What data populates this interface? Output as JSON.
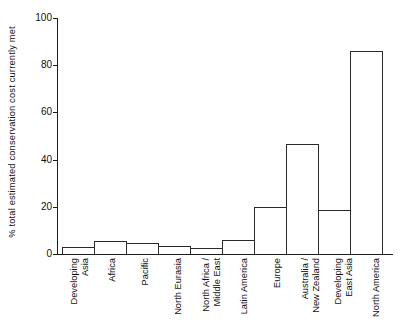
{
  "chart_data": {
    "type": "bar",
    "title": "",
    "subtitle": "",
    "xlabel": "",
    "ylabel": "% total estimated conservation cost currently met",
    "ylim": [
      0,
      100
    ],
    "yticks": [
      0,
      20,
      40,
      60,
      80,
      100
    ],
    "grid": false,
    "legend": null,
    "orientation": "vertical",
    "bar_style": {
      "fill": "#ffffff",
      "edge": "#2a2a2a",
      "adjacent": true
    },
    "axis_color": "#1b1b1b",
    "categories": [
      "Developing Asia",
      "Africa",
      "Pacific",
      "North Eurasia",
      "North Africa / Middle East",
      "Latin America",
      "Europe",
      "Australia / New Zealand",
      "Developing East Asia",
      "North America"
    ],
    "category_lines": [
      [
        "Developing",
        "Asia"
      ],
      [
        "Africa"
      ],
      [
        "Pacific"
      ],
      [
        "North Eurasia"
      ],
      [
        "North Africa /",
        "Middle East"
      ],
      [
        "Latin America"
      ],
      [
        "Europe"
      ],
      [
        "Australia /",
        "New Zealand"
      ],
      [
        "Developing",
        "East Asia"
      ],
      [
        "North America"
      ]
    ],
    "values": [
      3,
      5.5,
      4.5,
      3.5,
      2.5,
      6,
      20,
      46.5,
      18.5,
      86
    ]
  }
}
